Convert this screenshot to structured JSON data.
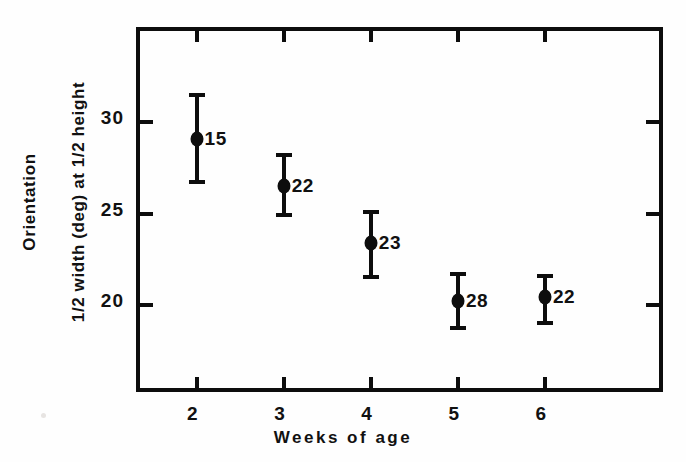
{
  "chart_data": {
    "type": "scatter",
    "title": "",
    "xlabel": "Weeks of age",
    "ylabel_lines": [
      "Orientation",
      "1/2 width (deg) at 1/2 height"
    ],
    "x": [
      2,
      3,
      4,
      5,
      6
    ],
    "xticklabels": [
      "2",
      "3",
      "4",
      "5",
      "6"
    ],
    "yticklabels": [
      "30",
      "25",
      "20"
    ],
    "yticks": [
      30,
      25,
      20
    ],
    "xlim": [
      1.35,
      7.4
    ],
    "ylim": [
      15.0,
      35.0
    ],
    "grid": false,
    "legend": null,
    "series": [
      {
        "name": "Orientation 1/2 width at 1/2 height",
        "marker": "filled-circle",
        "values": [
          29.1,
          26.5,
          23.4,
          20.2,
          20.4
        ],
        "err_low": [
          26.6,
          24.8,
          21.4,
          18.6,
          18.9
        ],
        "err_high": [
          31.6,
          28.3,
          25.2,
          21.8,
          21.7
        ],
        "point_labels": [
          "15",
          "22",
          "23",
          "28",
          "22"
        ]
      }
    ],
    "annotations": [
      {
        "text": "15",
        "x": 2,
        "y": 29.1,
        "note": "sample size n"
      },
      {
        "text": "22",
        "x": 3,
        "y": 26.5,
        "note": "sample size n"
      },
      {
        "text": "23",
        "x": 4,
        "y": 23.4,
        "note": "sample size n"
      },
      {
        "text": "28",
        "x": 5,
        "y": 20.2,
        "note": "sample size n"
      },
      {
        "text": "22",
        "x": 6,
        "y": 20.4,
        "note": "sample size n"
      }
    ],
    "colors": {
      "ink": "#0d0d0d",
      "background": "#fefefe"
    }
  }
}
